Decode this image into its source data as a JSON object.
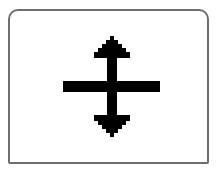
{
  "icon": {
    "name": "row-resize-cursor",
    "description": "Vertical split / row-resize cursor: horizontal bar with up and down arrows",
    "color": "#000000",
    "frame_border_color": "#6e6e6e",
    "background": "#ffffff"
  }
}
